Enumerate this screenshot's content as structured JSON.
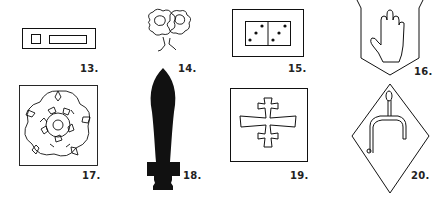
{
  "figures": [
    {
      "number": "13.",
      "description": "rectangle with small square and long bar"
    },
    {
      "number": "14.",
      "description": "two roses on a stem"
    },
    {
      "number": "15.",
      "description": "domino tile showing three and three pips in frame"
    },
    {
      "number": "16.",
      "description": "open hand on shield"
    },
    {
      "number": "17.",
      "description": "tudor rose in square"
    },
    {
      "number": "18.",
      "description": "black sword silhouette"
    },
    {
      "number": "19.",
      "description": "patriarchal cross in square"
    },
    {
      "number": "20.",
      "description": "spur on lozenge"
    }
  ],
  "colors": {
    "ink": "#111111",
    "background": "#ffffff"
  }
}
